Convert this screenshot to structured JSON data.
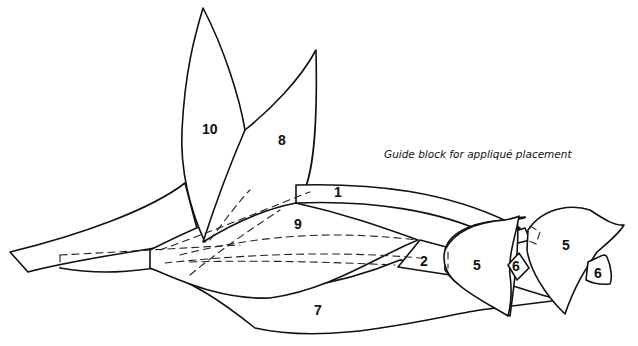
{
  "figure": {
    "caption": "Guide block for appliqué placement",
    "cropped_header_text": "",
    "line_color": "#111111",
    "background": "#ffffff"
  },
  "pieces": [
    {
      "id": "1",
      "label": "1",
      "description": "long stem strip"
    },
    {
      "id": "2",
      "label": "2",
      "description": "short stem into left tulip"
    },
    {
      "id": "5a",
      "label": "5",
      "description": "left tulip head"
    },
    {
      "id": "6a",
      "label": "6",
      "description": "left tulip petal"
    },
    {
      "id": "5b",
      "label": "5",
      "description": "right tulip head"
    },
    {
      "id": "6b",
      "label": "6",
      "description": "right tulip petal"
    },
    {
      "id": "7",
      "label": "7",
      "description": "lower leaf"
    },
    {
      "id": "8",
      "label": "8",
      "description": "upright leaf (right)"
    },
    {
      "id": "9",
      "label": "9",
      "description": "center leaf"
    },
    {
      "id": "10",
      "label": "10",
      "description": "upright leaf (left)"
    }
  ]
}
